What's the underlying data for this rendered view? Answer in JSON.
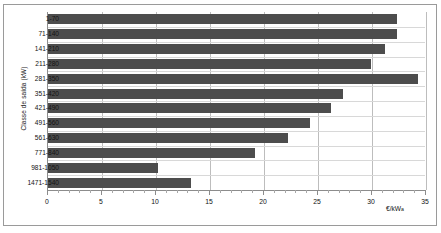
{
  "chart_data": {
    "type": "bar",
    "orientation": "horizontal",
    "title": "",
    "xlabel": "€/kW a",
    "ylabel": "Classe de saída (kW)",
    "categories": [
      "1-70",
      "71-140",
      "141-210",
      "211-280",
      "281-350",
      "351-420",
      "421-490",
      "491-560",
      "561-630",
      "771-840",
      "981-1050",
      "1471-1540"
    ],
    "values": [
      32.3,
      32.3,
      31.2,
      29.9,
      34.3,
      27.3,
      26.2,
      24.3,
      22.2,
      19.2,
      10.2,
      13.2
    ],
    "xlim": [
      0,
      35
    ],
    "xticks": [
      0,
      5,
      10,
      15,
      20,
      25,
      30,
      35
    ],
    "xtick_labels": [
      "0",
      "5",
      "10",
      "15",
      "20",
      "25",
      "30",
      "35"
    ],
    "minor_tick_step": 1,
    "grid": true,
    "legend": false,
    "bar_color": "#4d4d4d",
    "gridline_color": "#bdbdbd",
    "background_color": "#ffffff"
  },
  "axis": {
    "y_title": "Classe de saída (kW)",
    "x_unit_main": "€/kW",
    "x_unit_sub": "a"
  }
}
